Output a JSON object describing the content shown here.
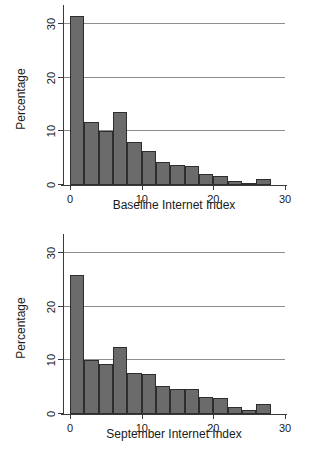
{
  "figure": {
    "panels": [
      "top",
      "bottom"
    ],
    "bar_color": "#6b6b6b",
    "bar_edge_color": "#2e2e2e",
    "grid_color": "#8e8e8e",
    "axis_color": "#3a3a3a"
  },
  "chart_data": [
    {
      "type": "bar",
      "title": "",
      "xlabel": "Baseline Internet Index",
      "ylabel": "Percentage",
      "xlim": [
        -1,
        30
      ],
      "ylim": [
        0,
        32
      ],
      "xticks": [
        0,
        10,
        20,
        30
      ],
      "xticklabels": [
        "0",
        "10",
        "20",
        "30"
      ],
      "yticks": [
        0,
        10,
        20,
        30
      ],
      "yticklabels": [
        "0",
        "10",
        "20",
        "30"
      ],
      "grid": "horizontal",
      "legend": "none",
      "bin_width": 2,
      "bin_starts": [
        0,
        2,
        4,
        6,
        8,
        10,
        12,
        14,
        16,
        18,
        20,
        22,
        24,
        26
      ],
      "categories": [
        "0-2",
        "2-4",
        "4-6",
        "6-8",
        "8-10",
        "10-12",
        "12-14",
        "14-16",
        "16-18",
        "18-20",
        "20-22",
        "22-24",
        "24-26",
        "26-28"
      ],
      "values": [
        31.5,
        11.7,
        10.0,
        13.5,
        8.0,
        6.4,
        4.3,
        3.7,
        3.5,
        2.1,
        1.7,
        0.8,
        0.3,
        1.1
      ]
    },
    {
      "type": "bar",
      "title": "",
      "xlabel": "September Internet Index",
      "ylabel": "Percentage",
      "xlim": [
        -1,
        30
      ],
      "ylim": [
        0,
        32
      ],
      "xticks": [
        0,
        10,
        20,
        30
      ],
      "xticklabels": [
        "0",
        "10",
        "20",
        "30"
      ],
      "yticks": [
        0,
        10,
        20,
        30
      ],
      "yticklabels": [
        "0",
        "10",
        "20",
        "30"
      ],
      "grid": "horizontal",
      "legend": "none",
      "bin_width": 2,
      "bin_starts": [
        0,
        2,
        4,
        6,
        8,
        10,
        12,
        14,
        16,
        18,
        20,
        22,
        24,
        26
      ],
      "categories": [
        "0-2",
        "2-4",
        "4-6",
        "6-8",
        "8-10",
        "10-12",
        "12-14",
        "14-16",
        "16-18",
        "18-20",
        "20-22",
        "22-24",
        "24-26",
        "26-28"
      ],
      "values": [
        25.8,
        10.0,
        9.3,
        12.4,
        7.6,
        7.4,
        5.2,
        4.6,
        4.6,
        3.1,
        2.9,
        1.3,
        0.7,
        1.9
      ]
    }
  ]
}
